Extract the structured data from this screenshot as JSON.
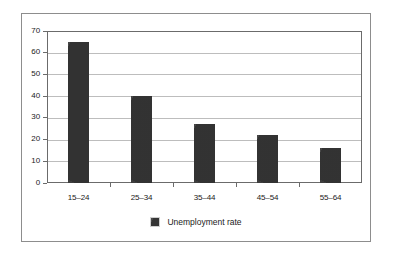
{
  "chart_data": {
    "type": "bar",
    "title": "",
    "subtitle": "",
    "xlabel": "",
    "ylabel": "",
    "categories": [
      "15–24",
      "25–34",
      "35–44",
      "45–54",
      "55–64"
    ],
    "series": [
      {
        "name": "Unemployment rate",
        "values": [
          65,
          40,
          27,
          22,
          16
        ],
        "color": "#3b3b3b"
      }
    ],
    "ylim": [
      0,
      70
    ],
    "ytick_values": [
      0,
      10,
      20,
      30,
      40,
      50,
      60,
      70
    ],
    "ytick_labels": [
      "0",
      "10",
      "20",
      "30",
      "40",
      "50",
      "60",
      "70"
    ],
    "grid": true,
    "grid_axis": "y",
    "legend": {
      "position": "bottom-center",
      "entries": [
        {
          "label": "Unemployment rate",
          "color": "#3b3b3b"
        }
      ]
    },
    "annotations": []
  },
  "figure": {
    "frame_color": "#8d8d8d",
    "axis_color": "#6b6b6b",
    "grid_color": "#bdbdbd",
    "background": "#ffffff",
    "text_color": "#1a1a1a"
  },
  "axes": {
    "y": {
      "ticks": [
        {
          "value": 0,
          "label": "0"
        },
        {
          "value": 10,
          "label": "10"
        },
        {
          "value": 20,
          "label": "20"
        },
        {
          "value": 30,
          "label": "30"
        },
        {
          "value": 40,
          "label": "40"
        },
        {
          "value": 50,
          "label": "50"
        },
        {
          "value": 60,
          "label": "60"
        },
        {
          "value": 70,
          "label": "70"
        }
      ]
    },
    "x": {
      "ticks": [
        {
          "label": "15–24"
        },
        {
          "label": "25–34"
        },
        {
          "label": "35–44"
        },
        {
          "label": "45–54"
        },
        {
          "label": "55–64"
        }
      ]
    }
  },
  "legend": {
    "swatch_name": "legend-color-swatch",
    "label": "Unemployment rate"
  }
}
